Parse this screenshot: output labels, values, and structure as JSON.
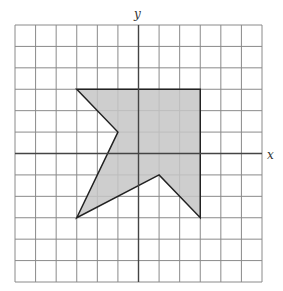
{
  "diagram": {
    "type": "coordinate-grid-with-polygon",
    "grid": {
      "x_min": -6,
      "x_max": 6,
      "y_min": -6,
      "y_max": 6,
      "step": 1,
      "left_px": 15,
      "top_px": 25,
      "right_px": 262,
      "bottom_px": 282
    },
    "axes": {
      "x_label": "x",
      "y_label": "y"
    },
    "polygon": {
      "name": "shaded-shape",
      "vertices": [
        [
          -3,
          3
        ],
        [
          3,
          3
        ],
        [
          3,
          -3
        ],
        [
          1,
          -1
        ],
        [
          -3,
          -3
        ],
        [
          -1,
          1
        ]
      ],
      "fill": "#c6c6c6",
      "stroke": "#222222"
    },
    "colors": {
      "grid_line": "#8a8a8a",
      "axis_line": "#444444",
      "background": "#ffffff"
    }
  }
}
